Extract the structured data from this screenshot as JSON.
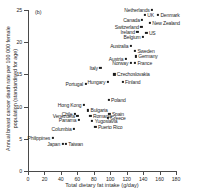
{
  "panel": {
    "label": "(b)"
  },
  "chart_data": {
    "type": "scatter",
    "title": "",
    "xlabel": "Total dietary fat intake (g/day)",
    "ylabel": "Annual breast cancer death rate per 100 000 female population (standardised for age)",
    "xlim": [
      0,
      180
    ],
    "ylim": [
      0,
      25
    ],
    "xticks": [
      0,
      20,
      40,
      60,
      80,
      100,
      120,
      140,
      160,
      180
    ],
    "yticks": [
      0,
      5,
      10,
      15,
      20,
      25
    ],
    "grid": false,
    "legend": "none",
    "points": [
      {
        "name": "Netherlands",
        "x": 151,
        "y": 25.0,
        "label_side": "left"
      },
      {
        "name": "Denmark",
        "x": 158,
        "y": 24.3,
        "label_side": "right"
      },
      {
        "name": "UK",
        "x": 142,
        "y": 24.2,
        "label_side": "right"
      },
      {
        "name": "Canada",
        "x": 139,
        "y": 23.4,
        "label_side": "left"
      },
      {
        "name": "New Zealand",
        "x": 148,
        "y": 23.0,
        "label_side": "right"
      },
      {
        "name": "Switzerland",
        "x": 138,
        "y": 22.4,
        "label_side": "left"
      },
      {
        "name": "Ireland",
        "x": 133,
        "y": 21.6,
        "label_side": "left"
      },
      {
        "name": "US",
        "x": 144,
        "y": 21.4,
        "label_side": "right"
      },
      {
        "name": "Belgium",
        "x": 140,
        "y": 20.8,
        "label_side": "left"
      },
      {
        "name": "Australia",
        "x": 125,
        "y": 19.4,
        "label_side": "left"
      },
      {
        "name": "Sweden",
        "x": 130,
        "y": 18.6,
        "label_side": "right"
      },
      {
        "name": "Germany",
        "x": 131,
        "y": 17.8,
        "label_side": "right"
      },
      {
        "name": "Austria",
        "x": 119,
        "y": 17.4,
        "label_side": "left"
      },
      {
        "name": "France",
        "x": 130,
        "y": 16.8,
        "label_side": "right"
      },
      {
        "name": "Norway",
        "x": 125,
        "y": 16.8,
        "label_side": "left"
      },
      {
        "name": "Italy",
        "x": 88,
        "y": 16.0,
        "label_side": "left"
      },
      {
        "name": "Czechoslovakia",
        "x": 105,
        "y": 15.0,
        "label_side": "right"
      },
      {
        "name": "Finland",
        "x": 115,
        "y": 13.8,
        "label_side": "right"
      },
      {
        "name": "Hungary",
        "x": 97,
        "y": 13.8,
        "label_side": "left"
      },
      {
        "name": "Portugal",
        "x": 70,
        "y": 13.5,
        "label_side": "left"
      },
      {
        "name": "Poland",
        "x": 98,
        "y": 11.0,
        "label_side": "right"
      },
      {
        "name": "Hong Kong",
        "x": 68,
        "y": 10.2,
        "label_side": "left"
      },
      {
        "name": "Bulgaria",
        "x": 73,
        "y": 9.4,
        "label_side": "right"
      },
      {
        "name": "Chile",
        "x": 57,
        "y": 8.9,
        "label_side": "left"
      },
      {
        "name": "Spain",
        "x": 99,
        "y": 8.9,
        "label_side": "right"
      },
      {
        "name": "Romania",
        "x": 76,
        "y": 8.6,
        "label_side": "right"
      },
      {
        "name": "Greece",
        "x": 97,
        "y": 8.3,
        "label_side": "right"
      },
      {
        "name": "Venezuela",
        "x": 60,
        "y": 8.5,
        "label_side": "left"
      },
      {
        "name": "Panama",
        "x": 62,
        "y": 7.9,
        "label_side": "left"
      },
      {
        "name": "Yugoslavia",
        "x": 78,
        "y": 7.8,
        "label_side": "right"
      },
      {
        "name": "Columbia",
        "x": 56,
        "y": 6.5,
        "label_side": "left"
      },
      {
        "name": "Puerto Rico",
        "x": 82,
        "y": 6.9,
        "label_side": "right"
      },
      {
        "name": "Philippines",
        "x": 30,
        "y": 5.1,
        "label_side": "left"
      },
      {
        "name": "Japan",
        "x": 42,
        "y": 4.2,
        "label_side": "left"
      },
      {
        "name": "Taiwan",
        "x": 46,
        "y": 4.2,
        "label_side": "right"
      }
    ]
  }
}
